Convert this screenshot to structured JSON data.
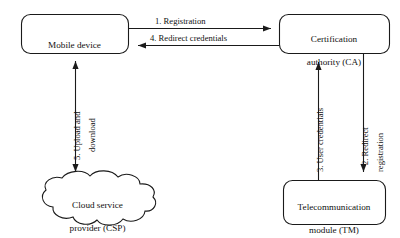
{
  "diagram": {
    "stroke_color": "#1a1a1a",
    "background_color": "#ffffff",
    "nodes": [
      {
        "id": "mobile-device",
        "shape": "rounded-rect",
        "label": "Mobile device"
      },
      {
        "id": "certification-authority",
        "shape": "rounded-rect",
        "label_line1": "Certification",
        "label_line2": "authority (CA)"
      },
      {
        "id": "cloud-service-provider",
        "shape": "cloud",
        "label_line1": "Cloud service",
        "label_line2": "provider (CSP)"
      },
      {
        "id": "telecommunication-module",
        "shape": "rounded-rect",
        "label_line1": "Telecommunication",
        "label_line2": "module (TM)"
      }
    ],
    "edges": [
      {
        "id": "edge-registration",
        "from": "mobile-device",
        "to": "certification-authority",
        "label": "1. Registration",
        "direction": "right"
      },
      {
        "id": "edge-redirect-credentials",
        "from": "certification-authority",
        "to": "mobile-device",
        "label": "4. Redirect credentials",
        "direction": "left"
      },
      {
        "id": "edge-redirect-registration",
        "from": "certification-authority",
        "to": "telecommunication-module",
        "label_line1": "2. Redirect",
        "label_line2": "registration",
        "direction": "down"
      },
      {
        "id": "edge-user-credentials",
        "from": "telecommunication-module",
        "to": "certification-authority",
        "label": "3. User credentials",
        "direction": "up"
      },
      {
        "id": "edge-upload-download",
        "from": "mobile-device",
        "to": "cloud-service-provider",
        "label_line1": "5. Upload and",
        "label_line2": "download",
        "direction": "both"
      }
    ]
  }
}
